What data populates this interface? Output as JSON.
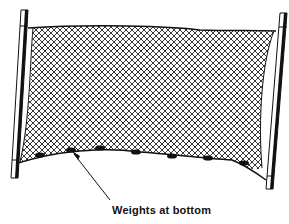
{
  "diagram": {
    "annotation": {
      "label": "Weights at bottom",
      "points_to": "weight on the bottom rope of the net"
    },
    "components": [
      "left-pole",
      "right-pole",
      "net-mesh",
      "float-line",
      "lead-line",
      "weights"
    ],
    "weights_count": 7,
    "colors": {
      "line": "#111111",
      "background": "#ffffff"
    }
  }
}
